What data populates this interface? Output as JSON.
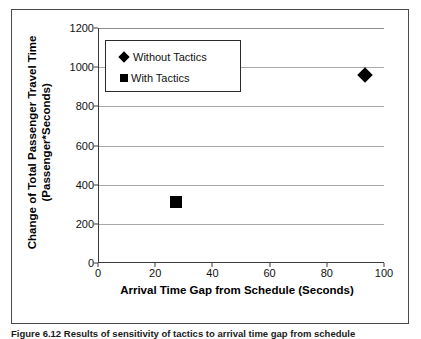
{
  "chart_data": {
    "type": "scatter",
    "title": "",
    "xlabel": "Arrival Time Gap from Schedule (Seconds)",
    "ylabel": "Change of Total Passenger Travel Time (Passenger*Seconds)",
    "ylabel_line1": "Change of Total Passenger Travel Time",
    "ylabel_line2": "(Passenger*Seconds)",
    "xlim": [
      0,
      100
    ],
    "ylim": [
      0,
      1200
    ],
    "xticks": [
      0,
      20,
      40,
      60,
      80,
      100
    ],
    "yticks": [
      0,
      200,
      400,
      600,
      800,
      1000,
      1200
    ],
    "grid": "horizontal",
    "legend_position": "upper-left-inside",
    "series": [
      {
        "name": "Without Tactics",
        "marker": "diamond",
        "color": "#000000",
        "points": [
          {
            "x": 93,
            "y": 960
          }
        ]
      },
      {
        "name": "With Tactics",
        "marker": "square",
        "color": "#000000",
        "points": [
          {
            "x": 27,
            "y": 310
          }
        ]
      }
    ]
  },
  "legend": {
    "entries": [
      {
        "label": "Without Tactics",
        "marker": "diamond"
      },
      {
        "label": "With Tactics",
        "marker": "square"
      }
    ]
  },
  "caption": {
    "text": "Figure 6.12 Results of sensitivity of tactics to arrival time gap from schedule"
  },
  "colors": {
    "marker": "#000000",
    "gridline": "#a8a8a8",
    "axis": "#3a3a3a",
    "frame": "#4a4a4a",
    "text": "#111111"
  }
}
